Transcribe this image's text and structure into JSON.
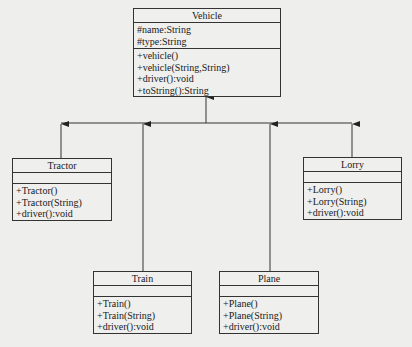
{
  "diagram": {
    "type": "uml-class-inheritance",
    "classes": {
      "vehicle": {
        "name": "Vehicle",
        "attributes": [
          "#name:String",
          "#type:String"
        ],
        "methods": [
          "+vehicle()",
          "+vehicle(String,String)",
          "+driver():void",
          "+toString():String"
        ]
      },
      "tractor": {
        "name": "Tractor",
        "attributes": [],
        "methods": [
          "+Tractor()",
          "+Tractor(String)",
          "+driver():void"
        ]
      },
      "lorry": {
        "name": "Lorry",
        "attributes": [],
        "methods": [
          "+Lorry()",
          "+Lorry(String)",
          "+driver():void"
        ]
      },
      "train": {
        "name": "Train",
        "attributes": [],
        "methods": [
          "+Train()",
          "+Train(String)",
          "+driver():void"
        ]
      },
      "plane": {
        "name": "Plane",
        "attributes": [],
        "methods": [
          "+Plane()",
          "+Plane(String)",
          "+driver():void"
        ]
      }
    },
    "relations": [
      {
        "from": "Tractor",
        "to": "Vehicle",
        "kind": "generalization"
      },
      {
        "from": "Train",
        "to": "Vehicle",
        "kind": "generalization"
      },
      {
        "from": "Plane",
        "to": "Vehicle",
        "kind": "generalization"
      },
      {
        "from": "Lorry",
        "to": "Vehicle",
        "kind": "generalization"
      }
    ],
    "colors": {
      "line": "#333333",
      "background": "#eeeeec"
    }
  }
}
